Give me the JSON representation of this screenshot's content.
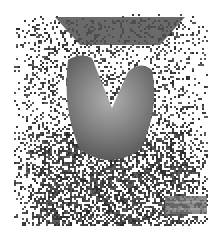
{
  "image": {
    "description": "Grayscale nuclear medicine scan (thyroid scintigraphy) showing a V/butterfly-shaped gland with surrounding speckle noise",
    "colors": {
      "background": "#ffffff",
      "noise_dark": "#3a3a3a",
      "gland": "#6e6e6e",
      "gland_highlight": "#a8a8a8"
    }
  }
}
